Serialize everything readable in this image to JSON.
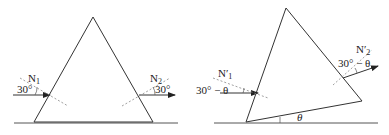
{
  "figures": [
    {
      "id": "symmetric-prism",
      "normal_in": {
        "base": "N",
        "sub": "1"
      },
      "normal_out": {
        "base": "N",
        "sub": "2"
      },
      "angle_in": "30°",
      "angle_out": "30°"
    },
    {
      "id": "tilted-prism",
      "normal_in": {
        "base": "N′",
        "sub": "1"
      },
      "normal_out": {
        "base": "N′",
        "sub": "2"
      },
      "angle_in": "30° − θ",
      "angle_out": "30° − θ",
      "tilt_angle": "θ"
    }
  ],
  "colors": {
    "line": "#333333",
    "dash": "#888888"
  }
}
